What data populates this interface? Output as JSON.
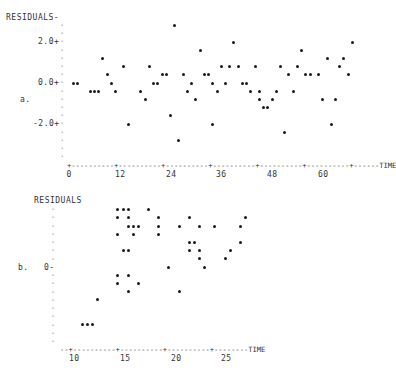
{
  "chart_data": [
    {
      "type": "scatter",
      "panel_label": "a.",
      "ylabel": "RESIDUALS",
      "xlabel": "TIME",
      "x_ticks": [
        "0",
        "12",
        "24",
        "36",
        "48",
        "60"
      ],
      "y_ticks": [
        "2.0+",
        "0.0+",
        "-2.0+"
      ],
      "xlim": [
        0,
        72
      ],
      "ylim": [
        -4.0,
        3.0
      ],
      "grid": false,
      "points": [
        {
          "x": 1,
          "y": 0.0
        },
        {
          "x": 2,
          "y": 0.0
        },
        {
          "x": 5,
          "y": -0.4
        },
        {
          "x": 6,
          "y": -0.4
        },
        {
          "x": 7,
          "y": -0.4
        },
        {
          "x": 8,
          "y": 1.2
        },
        {
          "x": 9,
          "y": 0.4
        },
        {
          "x": 10,
          "y": 0.0
        },
        {
          "x": 11,
          "y": -0.4
        },
        {
          "x": 13,
          "y": 0.8
        },
        {
          "x": 14,
          "y": -2.0
        },
        {
          "x": 17,
          "y": -0.4
        },
        {
          "x": 18,
          "y": -0.8
        },
        {
          "x": 19,
          "y": 0.8
        },
        {
          "x": 20,
          "y": 0.0
        },
        {
          "x": 21,
          "y": 0.0
        },
        {
          "x": 22,
          "y": 0.4
        },
        {
          "x": 23,
          "y": 0.4
        },
        {
          "x": 24,
          "y": -1.6
        },
        {
          "x": 25,
          "y": 2.8
        },
        {
          "x": 26,
          "y": -2.8
        },
        {
          "x": 27,
          "y": 0.4
        },
        {
          "x": 28,
          "y": -0.4
        },
        {
          "x": 29,
          "y": 0.0
        },
        {
          "x": 30,
          "y": -0.8
        },
        {
          "x": 31,
          "y": 1.6
        },
        {
          "x": 32,
          "y": 0.4
        },
        {
          "x": 33,
          "y": 0.4
        },
        {
          "x": 34,
          "y": -2.0
        },
        {
          "x": 34,
          "y": 0.0
        },
        {
          "x": 35,
          "y": -0.4
        },
        {
          "x": 36,
          "y": 0.8
        },
        {
          "x": 37,
          "y": 0.0
        },
        {
          "x": 38,
          "y": 0.8
        },
        {
          "x": 39,
          "y": 2.0
        },
        {
          "x": 40,
          "y": 0.8
        },
        {
          "x": 41,
          "y": 0.0
        },
        {
          "x": 42,
          "y": 0.0
        },
        {
          "x": 43,
          "y": -0.4
        },
        {
          "x": 44,
          "y": 0.8
        },
        {
          "x": 45,
          "y": -0.4
        },
        {
          "x": 45,
          "y": -0.8
        },
        {
          "x": 46,
          "y": -1.2
        },
        {
          "x": 47,
          "y": -1.2
        },
        {
          "x": 48,
          "y": -0.8
        },
        {
          "x": 49,
          "y": -0.4
        },
        {
          "x": 50,
          "y": 0.8
        },
        {
          "x": 51,
          "y": -2.4
        },
        {
          "x": 52,
          "y": 0.4
        },
        {
          "x": 53,
          "y": -0.4
        },
        {
          "x": 54,
          "y": 0.8
        },
        {
          "x": 55,
          "y": 1.6
        },
        {
          "x": 56,
          "y": 0.4
        },
        {
          "x": 57,
          "y": 0.4
        },
        {
          "x": 59,
          "y": 0.4
        },
        {
          "x": 60,
          "y": -0.8
        },
        {
          "x": 61,
          "y": 1.2
        },
        {
          "x": 62,
          "y": -2.0
        },
        {
          "x": 63,
          "y": -0.8
        },
        {
          "x": 64,
          "y": 0.8
        },
        {
          "x": 65,
          "y": 1.2
        },
        {
          "x": 66,
          "y": 0.4
        },
        {
          "x": 67,
          "y": 2.0
        }
      ]
    },
    {
      "type": "scatter",
      "panel_label": "b.",
      "ylabel": "RESIDUALS",
      "xlabel": "TIME",
      "x_ticks": [
        "10",
        "15",
        "20",
        "25"
      ],
      "y_ticks": [
        "0-"
      ],
      "xlim": [
        9,
        32
      ],
      "ylim": [
        -10,
        8
      ],
      "grid": false,
      "points": [
        {
          "x": 14.5,
          "y": 7
        },
        {
          "x": 15.0,
          "y": 7
        },
        {
          "x": 15.5,
          "y": 7
        },
        {
          "x": 17.5,
          "y": 7
        },
        {
          "x": 14.5,
          "y": 6
        },
        {
          "x": 15.5,
          "y": 6
        },
        {
          "x": 18.5,
          "y": 6
        },
        {
          "x": 21.5,
          "y": 6
        },
        {
          "x": 27.0,
          "y": 6
        },
        {
          "x": 15.5,
          "y": 5
        },
        {
          "x": 16.0,
          "y": 5
        },
        {
          "x": 16.5,
          "y": 5
        },
        {
          "x": 18.5,
          "y": 5
        },
        {
          "x": 20.5,
          "y": 5
        },
        {
          "x": 22.5,
          "y": 5
        },
        {
          "x": 24.0,
          "y": 5
        },
        {
          "x": 26.5,
          "y": 5
        },
        {
          "x": 14.5,
          "y": 4
        },
        {
          "x": 16.0,
          "y": 4
        },
        {
          "x": 18.5,
          "y": 4
        },
        {
          "x": 21.5,
          "y": 3
        },
        {
          "x": 22.0,
          "y": 3
        },
        {
          "x": 26.5,
          "y": 3
        },
        {
          "x": 15.0,
          "y": 2
        },
        {
          "x": 15.5,
          "y": 2
        },
        {
          "x": 21.5,
          "y": 2
        },
        {
          "x": 22.5,
          "y": 2
        },
        {
          "x": 25.5,
          "y": 2
        },
        {
          "x": 22.5,
          "y": 1
        },
        {
          "x": 25.0,
          "y": 1
        },
        {
          "x": 19.5,
          "y": 0
        },
        {
          "x": 23.0,
          "y": 0
        },
        {
          "x": 14.5,
          "y": -1
        },
        {
          "x": 15.5,
          "y": -1
        },
        {
          "x": 14.5,
          "y": -2
        },
        {
          "x": 16.5,
          "y": -2
        },
        {
          "x": 15.5,
          "y": -3
        },
        {
          "x": 20.5,
          "y": -3
        },
        {
          "x": 12.5,
          "y": -4
        },
        {
          "x": 11.0,
          "y": -7
        },
        {
          "x": 11.5,
          "y": -7
        },
        {
          "x": 12.0,
          "y": -7
        }
      ]
    }
  ],
  "labels": {
    "a_ylabel": "RESIDUALS-",
    "a_panel": "a.",
    "a_y2": "2.0+",
    "a_y0": "0.0+",
    "a_yn2": "-2.0+",
    "a_xaxis": "+----------+----------+----------+----------+----------+----------+------TIME",
    "a_xt": [
      "0",
      "12",
      "24",
      "36",
      "48",
      "60"
    ],
    "b_ylabel": "RESIDUALS",
    "b_panel": "b.",
    "b_y0": "0-",
    "b_xaxis": "--+----------+----------+----------+--------TIME",
    "b_xt": [
      "10",
      "15",
      "20",
      "25"
    ]
  }
}
